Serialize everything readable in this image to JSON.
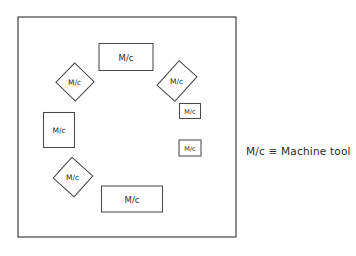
{
  "diagram": {
    "border": {
      "x": 18,
      "y": 17,
      "width": 218,
      "height": 220,
      "stroke_color": "#3a3a3a"
    },
    "machine_label": "M/c",
    "machines": [
      {
        "id": "machine-top",
        "label": "M/c",
        "shape": "rectangle",
        "cx": 126,
        "cy": 57,
        "width": 54,
        "height": 27,
        "rotation": 0,
        "font_size": 8.5
      },
      {
        "id": "machine-upper-left",
        "label": "M/c",
        "shape": "rectangle",
        "cx": 75,
        "cy": 82,
        "width": 27,
        "height": 27,
        "rotation": 44,
        "font_size": 7.5
      },
      {
        "id": "machine-upper-right",
        "label": "M/c",
        "shape": "rectangle",
        "cx": 177,
        "cy": 81,
        "width": 24,
        "height": 33,
        "rotation": 42,
        "font_size": 7.5
      },
      {
        "id": "machine-right-upper",
        "label": "M/c",
        "shape": "rectangle",
        "cx": 190,
        "cy": 111,
        "width": 21,
        "height": 15,
        "rotation": 0,
        "font_size": 6.5
      },
      {
        "id": "machine-right-lower",
        "label": "M/c",
        "shape": "rectangle",
        "cx": 190,
        "cy": 148,
        "width": 22,
        "height": 16,
        "rotation": 0,
        "font_size": 6.5
      },
      {
        "id": "machine-left",
        "label": "M/c",
        "shape": "rectangle",
        "cx": 59,
        "cy": 130,
        "width": 31,
        "height": 35,
        "rotation": 0,
        "font_size": 7.5
      },
      {
        "id": "machine-lower-left",
        "label": "M/c",
        "shape": "rectangle",
        "cx": 73,
        "cy": 177,
        "width": 28,
        "height": 28,
        "rotation": 42,
        "font_size": 7.5
      },
      {
        "id": "machine-bottom",
        "label": "M/c",
        "shape": "rectangle",
        "cx": 132,
        "cy": 199,
        "width": 61,
        "height": 26,
        "rotation": 0,
        "font_size": 8.5
      }
    ]
  },
  "legend": {
    "text": "M/c ≡ Machine tool",
    "x": 246,
    "y": 145
  }
}
